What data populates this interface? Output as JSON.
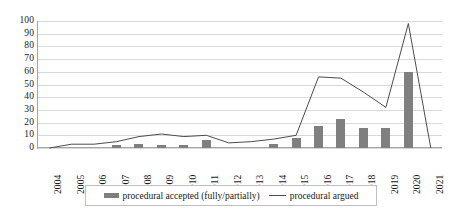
{
  "chart_data": {
    "type": "bar",
    "title": "",
    "xlabel": "",
    "ylabel": "",
    "ylim": [
      0,
      100
    ],
    "ytick_step": 10,
    "grid": true,
    "legend_position": "bottom",
    "categories": [
      "2004",
      "2005",
      "2006",
      "2007",
      "2008",
      "2009",
      "2010",
      "2011",
      "2012",
      "2013",
      "2014",
      "2015",
      "2016",
      "2017",
      "2018",
      "2019",
      "2020",
      "2021"
    ],
    "yticks": [
      "100",
      "90",
      "80",
      "70",
      "60",
      "50",
      "40",
      "30",
      "20",
      "10",
      "0"
    ],
    "series": [
      {
        "name": "procedural accepted (fully/partially)",
        "type": "bar",
        "color": "#7f7f7f",
        "values": [
          0,
          0,
          0,
          2,
          3,
          2,
          2,
          6,
          0,
          0,
          3,
          8,
          17,
          23,
          16,
          16,
          60,
          0
        ]
      },
      {
        "name": "procedural argued",
        "type": "line",
        "color": "#4d4d4d",
        "values": [
          0,
          3,
          3,
          5,
          9,
          11,
          9,
          10,
          4,
          5,
          7,
          10,
          56,
          55,
          44,
          32,
          98,
          0
        ]
      }
    ],
    "legend": [
      {
        "label": "procedural accepted (fully/partially)",
        "marker": "bar",
        "color": "#7f7f7f"
      },
      {
        "label": "procedural argued",
        "marker": "line",
        "color": "#4d4d4d"
      }
    ]
  }
}
